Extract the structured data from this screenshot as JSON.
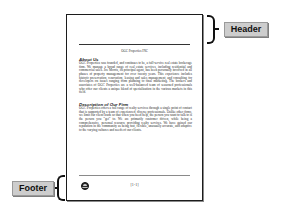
{
  "document": {
    "header": {
      "title": "OGC Properties INC"
    },
    "sections": [
      {
        "title": "About Us",
        "body": "OGC Properties was founded, and continues to be, a full-service real estate brokerage firm. We manage a broad range of real estate services, including residential and commercial sales. Joe Morris, its principal agent, has been personally involved in all phases of property management for over twenty years. This experience includes historic preservation, renovation, leasing and sales management, and consulting for developers on issues ranging from planning to final marketing. The brokers and associates of OGC Properties are a well-balanced team of seasoned professionals who offer our clients a unique blend of specialization in the various markets in this field."
      },
      {
        "title": "Description of Our Firm",
        "body": "OGC Properties offers a full range of realty services through a single point of contact that is supported by a team of experienced, diverse professionals. Unlike other firms, we limit our client loads so that when you need help, the person you want to talk to is the person you \"get\" to. We are primarily customer driven, while being a comprehensive, personal resource providing realty services. We have gained our reputation in the community as being fast, flexible, unusually accurate, and adaptive to the varying cultures and needs of our clients."
      }
    ],
    "footer": {
      "logo_icon": "company-logo-icon",
      "page_number": "[1-1]"
    }
  },
  "callouts": {
    "header_label": "Header",
    "footer_label": "Footer"
  }
}
